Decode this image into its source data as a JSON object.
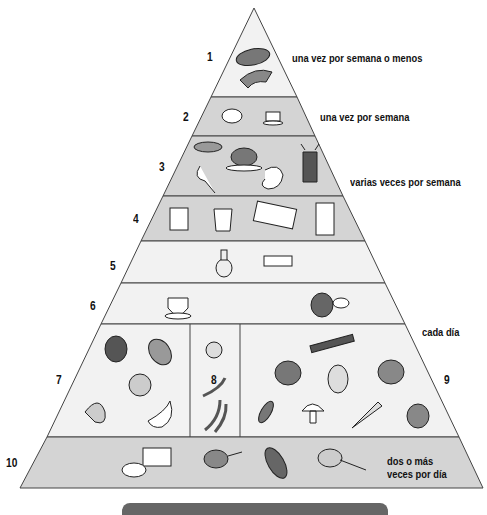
{
  "colors": {
    "shaded": "#d4d4d4",
    "light": "#f2f2f2",
    "line": "#444444",
    "bar": "#666666"
  },
  "tiers": [
    {
      "number": "1",
      "label": "una vez por semana o menos",
      "foods": [
        "steak",
        "ham-slice"
      ]
    },
    {
      "number": "2",
      "label": "una vez por semana",
      "foods": [
        "sugar-bowl",
        "cake-slice"
      ]
    },
    {
      "number": "3",
      "label": "varias veces por semana",
      "foods": [
        "fish",
        "roast-chicken",
        "chicken-leg",
        "shrimp",
        "lobster"
      ]
    },
    {
      "number": "4",
      "label": "",
      "foods": [
        "cheese",
        "yogurt-cup",
        "egg-carton",
        "milk-carton"
      ]
    },
    {
      "number": "5",
      "label": "",
      "foods": [
        "oil-cruet",
        "butter-dish"
      ]
    },
    {
      "number": "6",
      "label": "",
      "foods": [
        "coffee-cup",
        "teapot-and-cup"
      ]
    },
    {
      "number": "7",
      "label": "",
      "foods": [
        "apple",
        "grapes",
        "orange",
        "banana",
        "melon-slice"
      ]
    },
    {
      "number": "8",
      "label": "",
      "foods": [
        "beans",
        "green-beans"
      ]
    },
    {
      "number": "9",
      "label": "cada día",
      "foods": [
        "celery",
        "tomato",
        "potato",
        "cabbage",
        "peas",
        "mushroom",
        "carrot",
        "onion"
      ]
    },
    {
      "number": "10",
      "label": "dos o más veces por día",
      "label_lines": [
        "dos o más",
        "veces por día"
      ],
      "foods": [
        "bread",
        "cereal-bowl",
        "corn",
        "rice-bowl"
      ]
    }
  ]
}
